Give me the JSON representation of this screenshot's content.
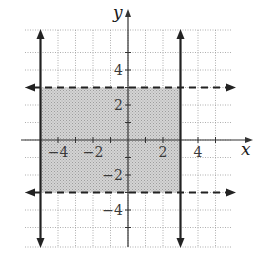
{
  "chart_data": {
    "type": "line",
    "title": "",
    "xlabel": "x",
    "ylabel": "y",
    "xlim": [
      -6,
      6
    ],
    "ylim": [
      -6,
      6
    ],
    "grid": true,
    "grid_style": "dotted",
    "x_ticks": [
      -4,
      -2,
      2,
      4
    ],
    "y_ticks": [
      4,
      2,
      -2,
      -4
    ],
    "tick_labels": {
      "x": [
        "−4",
        "−2",
        "2",
        "4"
      ],
      "y": [
        "4",
        "2",
        "−2",
        "−4"
      ]
    },
    "series": [
      {
        "name": "x = -5",
        "kind": "vertical",
        "value": -5,
        "style": "solid",
        "arrows": "both"
      },
      {
        "name": "x = 3",
        "kind": "vertical",
        "value": 3,
        "style": "solid",
        "arrows": "both"
      },
      {
        "name": "y = 3",
        "kind": "horizontal",
        "value": 3,
        "style": "dashed",
        "arrows": "both"
      },
      {
        "name": "y = -3",
        "kind": "horizontal",
        "value": -3,
        "style": "dashed",
        "arrows": "both"
      }
    ],
    "shaded_region": {
      "x": [
        -5,
        3
      ],
      "y": [
        -3,
        3
      ],
      "description": "-5 < x < 3 and -3 < y < 3"
    }
  },
  "colors": {
    "grid": "#9a9a9a",
    "axis": "#333333",
    "boundary": "#222222",
    "shade": "#c9c9c9"
  },
  "labels": {
    "x_axis": "x",
    "y_axis": "y"
  }
}
